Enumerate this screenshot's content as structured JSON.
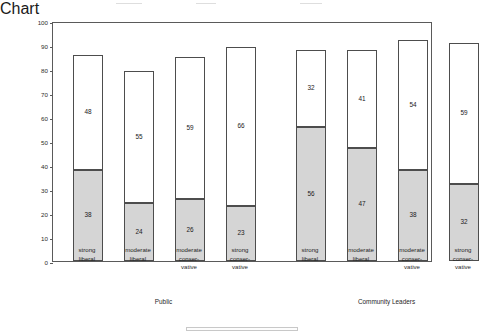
{
  "chart_data": {
    "type": "bar",
    "subtype": "stacked-two-segment",
    "title": "",
    "xlabel": "",
    "ylabel": "Percentage",
    "ylim": [
      0,
      100
    ],
    "yticks": [
      0,
      10,
      20,
      30,
      40,
      50,
      60,
      70,
      80,
      90,
      100
    ],
    "grid": false,
    "legend": "none",
    "groups": [
      {
        "name": "Public",
        "categories": [
          [
            "strong",
            "liberal"
          ],
          [
            "moderate",
            "liberal"
          ],
          [
            "moderate",
            "conser-",
            "vative"
          ],
          [
            "strong",
            "conser-",
            "vative"
          ]
        ],
        "bottom_values": [
          38,
          24,
          26,
          23
        ],
        "top_values": [
          48,
          55,
          59,
          66
        ],
        "totals": [
          86,
          79,
          85,
          89
        ]
      },
      {
        "name": "Community Leaders",
        "categories": [
          [
            "strong",
            "liberal"
          ],
          [
            "moderate",
            "liberal"
          ],
          [
            "moderate",
            "conser-",
            "vative"
          ],
          [
            "strong",
            "conser-",
            "vative"
          ]
        ],
        "bottom_values": [
          56,
          47,
          38,
          32
        ],
        "top_values": [
          32,
          41,
          54,
          59
        ],
        "totals": [
          88,
          88,
          92,
          91
        ]
      }
    ],
    "series": [
      {
        "name": "bottom-segment",
        "color": "#d5d5d5",
        "values": [
          38,
          24,
          26,
          23,
          56,
          47,
          38,
          32
        ]
      },
      {
        "name": "top-segment",
        "color": "#ffffff",
        "values": [
          48,
          55,
          59,
          66,
          32,
          41,
          54,
          59
        ]
      }
    ],
    "colors": {
      "bottom_fill": "#d5d5d5",
      "top_fill": "#ffffff",
      "outline": "#4d4d4d",
      "axis": "#5a5a5a",
      "text": "#1a1a1a"
    }
  }
}
